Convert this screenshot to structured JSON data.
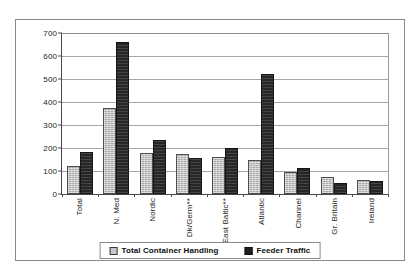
{
  "chart_data": {
    "type": "bar",
    "title": "",
    "subtitle": "",
    "xlabel": "",
    "ylabel": "",
    "ylim": [
      0,
      700
    ],
    "ytick_step": 100,
    "yticks": [
      700,
      600,
      500,
      400,
      300,
      200,
      100,
      0
    ],
    "grid": true,
    "legend_position": "bottom",
    "categories": [
      "Total",
      "N. Med",
      "Nordic",
      "Dk/Germ**",
      "East Baltic**",
      "Atlantic",
      "Channel",
      "Gr. Britain",
      "Ireland"
    ],
    "series": [
      {
        "name": "Total Container Handling",
        "color": "#aaaaaa",
        "values": [
          123,
          375,
          180,
          172,
          160,
          148,
          95,
          72,
          60
        ]
      },
      {
        "name": "Feeder Traffic",
        "color": "#262626",
        "values": [
          182,
          660,
          235,
          158,
          201,
          522,
          115,
          48,
          55
        ]
      }
    ]
  },
  "legend": {
    "entries": [
      {
        "label": "Total Container Handling",
        "swatch": "light"
      },
      {
        "label": "Feeder Traffic",
        "swatch": "dark"
      }
    ]
  },
  "colors": {
    "series_light": "#aaaaaa",
    "series_dark": "#262626",
    "gridline": "#a6a6a6",
    "axis": "#4a4a4a",
    "frame": "#8a8a8a",
    "background": "#ffffff",
    "text": "#1a1a1a"
  }
}
